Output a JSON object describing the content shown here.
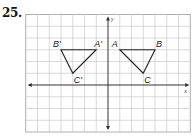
{
  "problem_number": "25.",
  "graph": {
    "x_range": [
      -7,
      7
    ],
    "y_range": [
      -4,
      6
    ],
    "axis_labels": {
      "x": "x",
      "y": "y"
    },
    "colors": {
      "grid": "#c8c8c8",
      "axes": "#333333",
      "triangle": "#222222"
    }
  },
  "triangles": [
    {
      "name": "original",
      "vertices": [
        {
          "label": "A",
          "x": 1,
          "y": 3
        },
        {
          "label": "B",
          "x": 4,
          "y": 3
        },
        {
          "label": "C",
          "x": 3,
          "y": 1
        }
      ]
    },
    {
      "name": "image",
      "vertices": [
        {
          "label": "A'",
          "x": -1,
          "y": 3
        },
        {
          "label": "B'",
          "x": -4,
          "y": 3
        },
        {
          "label": "C'",
          "x": -3,
          "y": 1
        }
      ]
    }
  ]
}
